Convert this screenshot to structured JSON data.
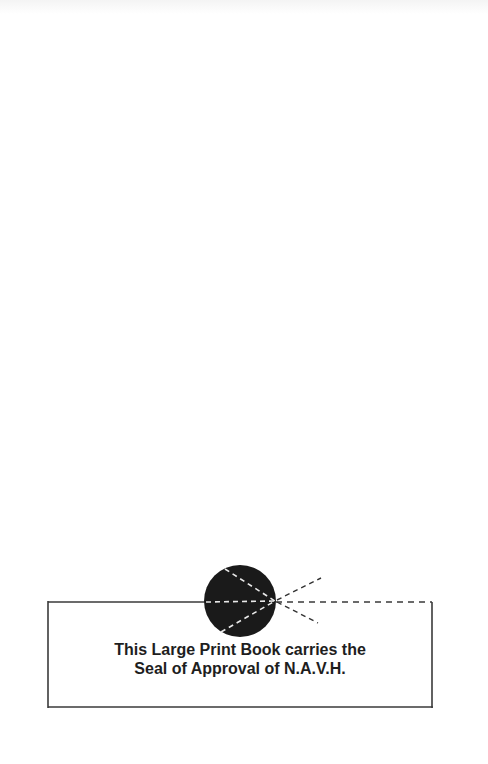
{
  "notice": {
    "line1": "This Large Print Book carries the",
    "line2": "Seal of Approval of N.A.V.H."
  },
  "seal": {
    "icon": "eye-seal-icon",
    "fill_color": "#1a1a1a",
    "ray_color": "#ffffff",
    "outside_ray_color": "#333333"
  },
  "box": {
    "border_color": "#3a3a3a"
  }
}
